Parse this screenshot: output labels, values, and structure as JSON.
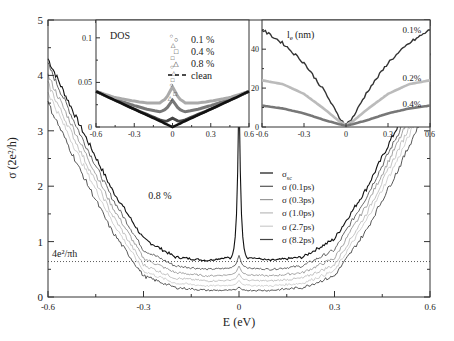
{
  "chart_data": [
    {
      "type": "line",
      "title": "",
      "xlabel": "E (eV)",
      "ylabel": "σ (2e²/h)",
      "xlim": [
        -0.6,
        0.6
      ],
      "ylim": [
        0,
        5
      ],
      "x_ticks": [
        "-0.6",
        "-0.3",
        "0",
        "0.3",
        "0.6"
      ],
      "y_ticks": [
        "0",
        "1",
        "2",
        "3",
        "4",
        "5"
      ],
      "annotations": [
        {
          "text": "0.8 %",
          "x": -0.14,
          "y": 1.35
        },
        {
          "text": "4e²/πh",
          "x": -0.52,
          "y": 0.78
        }
      ],
      "reference_line": {
        "label": "4e²/πh",
        "y": 0.64,
        "style": "dotted"
      },
      "legend": {
        "position": "center-right",
        "entries": [
          "σ_sc",
          "σ (0.1ps)",
          "σ (0.3ps)",
          "σ (1.0ps)",
          "σ (2.7ps)",
          "σ (8.2ps)"
        ]
      },
      "x": [
        -0.6,
        -0.5,
        -0.4,
        -0.3,
        -0.2,
        -0.1,
        -0.03,
        -0.01,
        0,
        0.01,
        0.03,
        0.1,
        0.2,
        0.3,
        0.4,
        0.5,
        0.6
      ],
      "series": [
        {
          "name": "σ_sc",
          "color": "#111111",
          "values": [
            4.3,
            3.1,
            1.95,
            1.05,
            0.72,
            0.66,
            0.72,
            1.2,
            3.8,
            1.2,
            0.72,
            0.66,
            0.72,
            1.05,
            1.95,
            3.1,
            4.35
          ]
        },
        {
          "name": "σ (0.1ps)",
          "color": "#555555",
          "values": [
            4.2,
            2.95,
            1.8,
            0.85,
            0.56,
            0.5,
            0.52,
            0.58,
            0.75,
            0.58,
            0.52,
            0.5,
            0.56,
            0.85,
            1.8,
            2.95,
            4.2
          ]
        },
        {
          "name": "σ (0.3ps)",
          "color": "#999999",
          "values": [
            4.0,
            2.8,
            1.65,
            0.7,
            0.44,
            0.38,
            0.4,
            0.44,
            0.56,
            0.44,
            0.4,
            0.38,
            0.44,
            0.7,
            1.65,
            2.8,
            4.0
          ]
        },
        {
          "name": "σ (1.0ps)",
          "color": "#bbbbbb",
          "values": [
            3.85,
            2.65,
            1.5,
            0.58,
            0.34,
            0.29,
            0.3,
            0.33,
            0.42,
            0.33,
            0.3,
            0.29,
            0.34,
            0.58,
            1.5,
            2.65,
            3.85
          ]
        },
        {
          "name": "σ (2.7ps)",
          "color": "#cccccc",
          "values": [
            3.7,
            2.5,
            1.38,
            0.47,
            0.25,
            0.2,
            0.21,
            0.23,
            0.3,
            0.23,
            0.21,
            0.2,
            0.25,
            0.47,
            1.38,
            2.5,
            3.7
          ]
        },
        {
          "name": "σ (8.2ps)",
          "color": "#444444",
          "values": [
            3.5,
            2.3,
            1.2,
            0.38,
            0.17,
            0.12,
            0.12,
            0.13,
            0.18,
            0.13,
            0.12,
            0.12,
            0.17,
            0.38,
            1.2,
            2.3,
            3.55
          ]
        }
      ]
    },
    {
      "type": "scatter",
      "title": "DOS",
      "xlabel": "",
      "ylabel": "",
      "xlim": [
        -0.6,
        0.6
      ],
      "ylim": [
        0,
        0.12
      ],
      "x_ticks": [
        "-0.6",
        "-0.3",
        "0",
        "0.3",
        "0.6"
      ],
      "y_ticks": [
        "0",
        "0.05",
        "0.1"
      ],
      "legend": {
        "position": "upper-right",
        "entries": [
          "0.1 %",
          "0.4 %",
          "0.8 %",
          "clean"
        ]
      },
      "x": [
        -0.6,
        -0.45,
        -0.3,
        -0.2,
        -0.1,
        -0.05,
        0,
        0.05,
        0.1,
        0.2,
        0.3,
        0.45,
        0.6
      ],
      "series": [
        {
          "name": "0.1 %",
          "marker": "circle",
          "values": [
            0.04,
            0.03,
            0.02,
            0.014,
            0.008,
            0.006,
            0.01,
            0.006,
            0.008,
            0.014,
            0.02,
            0.03,
            0.04
          ]
        },
        {
          "name": "0.4 %",
          "marker": "square",
          "values": [
            0.04,
            0.031,
            0.024,
            0.02,
            0.017,
            0.02,
            0.03,
            0.02,
            0.017,
            0.02,
            0.024,
            0.031,
            0.04
          ]
        },
        {
          "name": "0.8 %",
          "marker": "triangle",
          "values": [
            0.04,
            0.033,
            0.029,
            0.027,
            0.027,
            0.032,
            0.045,
            0.032,
            0.027,
            0.027,
            0.029,
            0.033,
            0.04
          ]
        },
        {
          "name": "clean",
          "style": "dashed",
          "values": [
            0.04,
            0.03,
            0.02,
            0.0133,
            0.0067,
            0.0033,
            0,
            0.0033,
            0.0067,
            0.0133,
            0.02,
            0.03,
            0.04
          ]
        }
      ]
    },
    {
      "type": "line",
      "title": "l_e (nm)",
      "xlabel": "",
      "ylabel": "",
      "xlim": [
        -0.6,
        0.6
      ],
      "ylim": [
        0,
        55
      ],
      "x_ticks": [
        "-0.6",
        "-0.3",
        "0",
        "0.3",
        "0.6"
      ],
      "y_ticks": [
        "0",
        "20",
        "40"
      ],
      "annotations": [
        {
          "text": "0.1%",
          "x": 0.47,
          "y": 50
        },
        {
          "text": "0.2%",
          "x": 0.47,
          "y": 25
        },
        {
          "text": "0.4%",
          "x": 0.47,
          "y": 12
        }
      ],
      "x": [
        -0.6,
        -0.45,
        -0.3,
        -0.15,
        -0.05,
        0,
        0.05,
        0.15,
        0.3,
        0.45,
        0.6
      ],
      "series": [
        {
          "name": "0.1%",
          "color": "#333333",
          "values": [
            50,
            43,
            33,
            18,
            5,
            1,
            5,
            18,
            33,
            43,
            50
          ]
        },
        {
          "name": "0.2%",
          "color": "#bbbbbb",
          "values": [
            24,
            22,
            17,
            9,
            3,
            1,
            3,
            9,
            17,
            22,
            24
          ]
        },
        {
          "name": "0.4%",
          "color": "#777777",
          "values": [
            11,
            9.5,
            7,
            3.5,
            1.5,
            0.5,
            1.5,
            3.5,
            7,
            9.5,
            11
          ]
        }
      ]
    }
  ],
  "labels": {
    "main_xlabel": "E (eV)",
    "main_ylabel": "σ (2e²/h)",
    "main_annotation": "0.8 %",
    "ref_label": "4e²/πh",
    "dos_title": "DOS",
    "le_title": "l",
    "le_sub": "e",
    "le_unit": "(nm)"
  }
}
